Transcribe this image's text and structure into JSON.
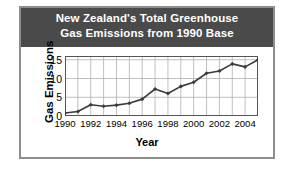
{
  "chart_data": {
    "type": "line",
    "title": "New Zealand's Total Greenhouse Gas Emissions from 1990 Base",
    "title_lines": [
      "New Zealand's Total Greenhouse",
      "Gas Emissions from 1990 Base"
    ],
    "xlabel": "Year",
    "ylabel": "Gas Emissions",
    "x": [
      1990,
      1991,
      1992,
      1993,
      1994,
      1995,
      1996,
      1997,
      1998,
      1999,
      2000,
      2001,
      2002,
      2003,
      2004,
      2005
    ],
    "values": [
      0.8,
      1.2,
      3.0,
      2.6,
      2.9,
      3.4,
      4.5,
      7.2,
      6.0,
      7.9,
      9.0,
      11.4,
      12.0,
      13.9,
      13.1,
      15.0
    ],
    "xlim": [
      1990,
      2005
    ],
    "ylim": [
      0,
      16
    ],
    "ytick_labels": [
      "0",
      "5",
      "10",
      "15"
    ],
    "ytick_values": [
      0,
      5,
      10,
      15
    ],
    "xtick_labels": [
      "1990",
      "1992",
      "1994",
      "1996",
      "1998",
      "2000",
      "2002",
      "2004"
    ],
    "xtick_values": [
      1990,
      1992,
      1994,
      1996,
      1998,
      2000,
      2002,
      2004
    ],
    "grid": true,
    "legend": null,
    "marker": "diamond",
    "colors": {
      "banner_background": "#4a4a4a",
      "banner_text": "#ffffff",
      "line": "#3b3b3b",
      "marker": "#3b3b3b",
      "grid": "#b0b0b0",
      "axis": "#555555",
      "frame": "#8d8d8d",
      "page_background": "#ffffff"
    }
  }
}
